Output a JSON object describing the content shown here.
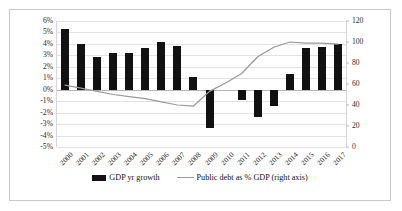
{
  "chart_data": {
    "type": "bar",
    "title": "",
    "xlabel": "",
    "ylabel": "",
    "categories": [
      "2000",
      "2001",
      "2002",
      "2003",
      "2004",
      "2005",
      "2006",
      "2007",
      "2008",
      "2009",
      "2010",
      "2011",
      "2012",
      "2013",
      "2014",
      "2015",
      "2016",
      "2017"
    ],
    "series": [
      {
        "name": "GDP yr growth",
        "type": "bar",
        "axis": "left",
        "color": "#111111",
        "values": [
          5.3,
          4.0,
          2.9,
          3.2,
          3.2,
          3.6,
          4.2,
          3.8,
          1.1,
          -3.3,
          0.0,
          -0.9,
          -2.4,
          -1.4,
          1.4,
          3.6,
          3.7,
          4.0
        ]
      },
      {
        "name": "Public debt as % GDP (right axis)",
        "type": "line",
        "axis": "right",
        "color": "#9a9a9a",
        "values": [
          59,
          56,
          53,
          50,
          48,
          46,
          43,
          40,
          39,
          53,
          61,
          70,
          86,
          95,
          100,
          99,
          99,
          98
        ]
      }
    ],
    "ylim": [
      -5,
      6
    ],
    "yticks": [
      "6%",
      "5%",
      "4%",
      "3%",
      "2%",
      "1%",
      "0%",
      "-1%",
      "-2%",
      "-3%",
      "-4%",
      "-5%"
    ],
    "ytick_values": [
      6,
      5,
      4,
      3,
      2,
      1,
      0,
      -1,
      -2,
      -3,
      -4,
      -5
    ],
    "y2lim": [
      0,
      120
    ],
    "y2ticks": [
      "120",
      "100",
      "80",
      "60",
      "40",
      "20",
      "0"
    ],
    "y2tick_values": [
      120,
      100,
      80,
      60,
      40,
      20,
      0
    ],
    "grid": true,
    "legend_position": "bottom",
    "legend": [
      {
        "label": "GDP yr growth",
        "marker": "bar",
        "color": "#111111"
      },
      {
        "label": "Public debt as % GDP (right axis)",
        "marker": "line",
        "color": "#9a9a9a"
      }
    ]
  }
}
